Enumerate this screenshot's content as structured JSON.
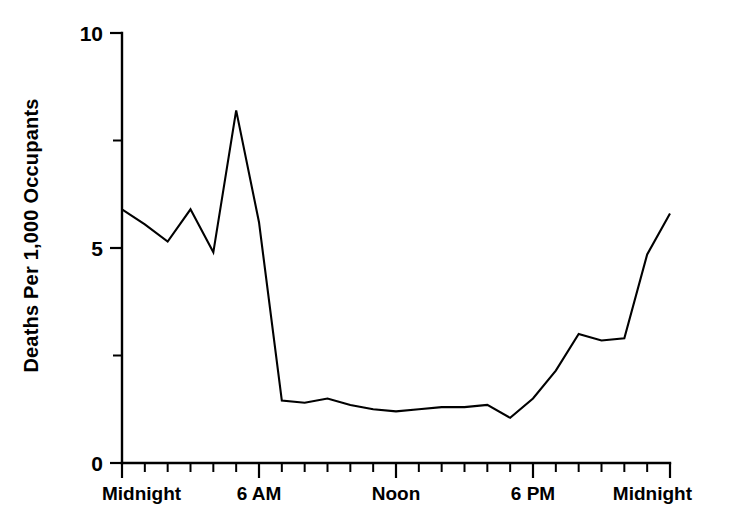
{
  "chart_data": {
    "type": "line",
    "title": "",
    "subtitle": "",
    "xlabel": "",
    "ylabel": "Deaths Per 1,000 Occupants",
    "xlim": [
      0,
      24
    ],
    "ylim": [
      0,
      10
    ],
    "grid": false,
    "legend": null,
    "series": [
      {
        "name": "Deaths Per 1,000 Occupants",
        "color": "#000000",
        "x": [
          0,
          1,
          2,
          3,
          4,
          5,
          6,
          7,
          8,
          9,
          10,
          11,
          12,
          13,
          14,
          15,
          16,
          17,
          18,
          19,
          20,
          21,
          22,
          23,
          24
        ],
        "values": [
          5.9,
          5.55,
          5.15,
          5.9,
          4.9,
          8.2,
          5.6,
          1.45,
          1.4,
          1.5,
          1.35,
          1.25,
          1.2,
          1.25,
          1.3,
          1.3,
          1.35,
          1.05,
          1.5,
          2.15,
          3.0,
          2.85,
          2.9,
          4.85,
          5.8
        ]
      }
    ],
    "y_axis": {
      "major_ticks": [
        0,
        5,
        10
      ],
      "major_tick_labels": [
        "0",
        "5",
        "10"
      ],
      "minor_ticks": [
        2.5,
        7.5
      ]
    },
    "x_axis": {
      "major_ticks": [
        0,
        6,
        12,
        18,
        24
      ],
      "major_tick_labels": [
        "Midnight",
        "6 AM",
        "Noon",
        "6 PM",
        "Midnight"
      ],
      "minor_tick_interval_hours": 1
    },
    "colors": {
      "line": "#000000",
      "axis": "#000000",
      "background": "#ffffff"
    }
  }
}
